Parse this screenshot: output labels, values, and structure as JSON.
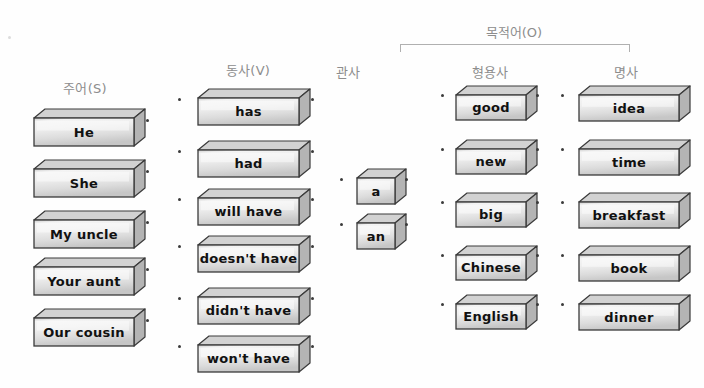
{
  "page": {
    "background_color": "#fefefe",
    "block_fill": "#eeeeee",
    "block_outline": "#3a3a3a",
    "label_color": "#8d8d8d"
  },
  "group_header": {
    "label": "목적어(O)",
    "bracket": {
      "left": 400,
      "right": 628,
      "top": 44
    }
  },
  "columns": [
    {
      "id": "subject",
      "header": "주어(S)",
      "header_x": 85,
      "header_y": 78,
      "box_x": 33,
      "box_w": 100,
      "box_h": 28,
      "font_size": 13,
      "items": [
        {
          "label": "He",
          "y": 108
        },
        {
          "label": "She",
          "y": 159
        },
        {
          "label": "My uncle",
          "y": 210
        },
        {
          "label": "Your aunt",
          "y": 257
        },
        {
          "label": "Our cousin",
          "y": 308
        }
      ],
      "dots_left": [],
      "dots_right": [
        {
          "x": 146,
          "y": 119
        },
        {
          "x": 146,
          "y": 170
        },
        {
          "x": 146,
          "y": 221
        },
        {
          "x": 146,
          "y": 268
        },
        {
          "x": 146,
          "y": 319
        }
      ]
    },
    {
      "id": "verb",
      "header": "동사(V)",
      "header_x": 248,
      "header_y": 60,
      "box_x": 197,
      "box_w": 101,
      "box_h": 27,
      "font_size": 13,
      "items": [
        {
          "label": "has",
          "y": 88
        },
        {
          "label": "had",
          "y": 140
        },
        {
          "label": "will have",
          "y": 188
        },
        {
          "label": "doesn't have",
          "y": 235
        },
        {
          "label": "didn't have",
          "y": 287
        },
        {
          "label": "won't have",
          "y": 335
        }
      ],
      "dots_left": [
        {
          "x": 178,
          "y": 98
        },
        {
          "x": 178,
          "y": 150
        },
        {
          "x": 178,
          "y": 198
        },
        {
          "x": 178,
          "y": 245
        },
        {
          "x": 178,
          "y": 297
        },
        {
          "x": 178,
          "y": 345
        }
      ],
      "dots_right": [
        {
          "x": 311,
          "y": 98
        },
        {
          "x": 311,
          "y": 150
        },
        {
          "x": 311,
          "y": 198
        },
        {
          "x": 311,
          "y": 245
        },
        {
          "x": 311,
          "y": 297
        },
        {
          "x": 311,
          "y": 345
        }
      ]
    },
    {
      "id": "article",
      "header": "관사",
      "header_x": 348,
      "header_y": 62,
      "box_x": 356,
      "box_w": 38,
      "box_h": 26,
      "font_size": 13,
      "items": [
        {
          "label": "a",
          "y": 168
        },
        {
          "label": "an",
          "y": 213
        }
      ],
      "dots_left": [
        {
          "x": 340,
          "y": 178
        },
        {
          "x": 340,
          "y": 223
        }
      ],
      "dots_right": [
        {
          "x": 405,
          "y": 178
        },
        {
          "x": 405,
          "y": 223
        }
      ]
    },
    {
      "id": "adjective",
      "header": "형용사",
      "header_x": 490,
      "header_y": 62,
      "box_x": 455,
      "box_w": 70,
      "box_h": 25,
      "font_size": 13,
      "items": [
        {
          "label": "good",
          "y": 85
        },
        {
          "label": "new",
          "y": 139
        },
        {
          "label": "big",
          "y": 192
        },
        {
          "label": "Chinese",
          "y": 245
        },
        {
          "label": "English",
          "y": 294
        }
      ],
      "dots_left": [
        {
          "x": 441,
          "y": 94
        },
        {
          "x": 441,
          "y": 148
        },
        {
          "x": 441,
          "y": 201
        },
        {
          "x": 441,
          "y": 254
        },
        {
          "x": 441,
          "y": 303
        }
      ],
      "dots_right": [
        {
          "x": 536,
          "y": 94
        },
        {
          "x": 536,
          "y": 148
        },
        {
          "x": 536,
          "y": 201
        },
        {
          "x": 536,
          "y": 254
        },
        {
          "x": 536,
          "y": 303
        }
      ]
    },
    {
      "id": "noun",
      "header": "명사",
      "header_x": 626,
      "header_y": 62,
      "box_x": 578,
      "box_w": 100,
      "box_h": 26,
      "font_size": 13,
      "items": [
        {
          "label": "idea",
          "y": 85
        },
        {
          "label": "time",
          "y": 139
        },
        {
          "label": "breakfast",
          "y": 192
        },
        {
          "label": "book",
          "y": 245
        },
        {
          "label": "dinner",
          "y": 294
        }
      ],
      "dots_left": [
        {
          "x": 561,
          "y": 94
        },
        {
          "x": 561,
          "y": 148
        },
        {
          "x": 561,
          "y": 201
        },
        {
          "x": 561,
          "y": 254
        },
        {
          "x": 561,
          "y": 303
        }
      ],
      "dots_right": []
    }
  ],
  "stray_dots": [
    {
      "x": 8,
      "y": 36
    }
  ]
}
